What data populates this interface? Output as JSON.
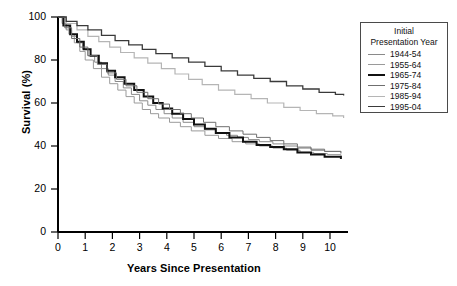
{
  "chart_data": {
    "type": "line",
    "title": "",
    "xlabel": "Years Since Presentation",
    "ylabel": "Survival (%)",
    "xlim": [
      0,
      10.6
    ],
    "ylim": [
      0,
      100
    ],
    "xticks": [
      "0",
      "1",
      "2",
      "3",
      "4",
      "5",
      "6",
      "7",
      "8",
      "9",
      "10"
    ],
    "yticks": [
      "0",
      "20",
      "40",
      "60",
      "80",
      "100"
    ],
    "grid": false,
    "legend_position": "outside-right-top",
    "legend_title_line1": "Initial",
    "legend_title_line2": "Presentation Year",
    "series": [
      {
        "name": "1944-54",
        "color": "#8a8a8a",
        "width": 1.0,
        "x": [
          0,
          0.15,
          0.3,
          0.5,
          0.7,
          0.9,
          1.1,
          1.35,
          1.6,
          1.85,
          2.1,
          2.4,
          2.7,
          3.0,
          3.3,
          3.6,
          3.9,
          4.2,
          4.6,
          5.0,
          5.4,
          5.8,
          6.2,
          6.6,
          7.0,
          7.4,
          7.9,
          8.3,
          8.8,
          9.3,
          9.8,
          10.4
        ],
        "values": [
          100,
          97,
          94,
          91,
          88,
          85,
          82,
          79,
          76,
          73,
          70,
          67,
          64,
          61,
          59,
          57,
          55,
          53,
          51,
          49,
          47.5,
          46,
          45,
          44,
          43,
          42,
          41,
          40,
          39,
          38,
          37.5,
          37
        ]
      },
      {
        "name": "1955-64",
        "color": "#9a9a9a",
        "width": 1.0,
        "x": [
          0,
          0.2,
          0.4,
          0.6,
          0.8,
          1.0,
          1.3,
          1.6,
          1.9,
          2.2,
          2.5,
          2.8,
          3.1,
          3.4,
          3.7,
          4.1,
          4.5,
          4.9,
          5.4,
          5.9,
          6.4,
          6.9,
          7.4,
          7.9,
          8.4,
          8.9,
          9.4,
          9.9,
          10.4
        ],
        "values": [
          100,
          96,
          92,
          88,
          84,
          80,
          76,
          72,
          69,
          66,
          63,
          60,
          57,
          55,
          53,
          51,
          49,
          47,
          45,
          43.5,
          42,
          41,
          40,
          39,
          38,
          37,
          36.5,
          36,
          35.5
        ]
      },
      {
        "name": "1965-74",
        "color": "#111111",
        "width": 2.0,
        "x": [
          0,
          0.2,
          0.45,
          0.7,
          0.95,
          1.2,
          1.5,
          1.8,
          2.1,
          2.45,
          2.8,
          3.15,
          3.5,
          3.85,
          4.2,
          4.6,
          5.0,
          5.4,
          5.8,
          6.3,
          6.8,
          7.3,
          7.8,
          8.3,
          8.8,
          9.3,
          9.8,
          10.4
        ],
        "values": [
          100,
          96,
          92,
          88.5,
          85,
          82,
          78.5,
          75,
          72,
          69,
          66,
          63,
          60,
          57.5,
          55,
          52.5,
          50,
          48,
          46,
          44,
          42,
          40.5,
          39.5,
          38.5,
          37,
          36,
          35,
          34
        ]
      },
      {
        "name": "1975-84",
        "color": "#6f6f6f",
        "width": 1.0,
        "x": [
          0,
          0.25,
          0.5,
          0.8,
          1.1,
          1.45,
          1.8,
          2.15,
          2.5,
          2.9,
          3.3,
          3.7,
          4.1,
          4.5,
          4.9,
          5.35,
          5.8,
          6.3,
          6.8,
          7.3,
          7.8,
          8.3,
          8.8,
          9.3,
          9.8,
          10.4
        ],
        "values": [
          100,
          95,
          90,
          86,
          82,
          78,
          74,
          71,
          68,
          65,
          62,
          59.5,
          57,
          55,
          53,
          51,
          49,
          47,
          45.5,
          44,
          42.5,
          41,
          39.5,
          38.5,
          37.5,
          36.5
        ]
      },
      {
        "name": "1985-94",
        "color": "#b5b5b5",
        "width": 1.2,
        "x": [
          0,
          0.3,
          0.7,
          1.1,
          1.5,
          1.9,
          2.3,
          2.8,
          3.3,
          3.8,
          4.3,
          4.8,
          5.3,
          5.9,
          6.5,
          7.1,
          7.7,
          8.3,
          8.9,
          9.5,
          10.1,
          10.5
        ],
        "values": [
          100,
          97,
          94,
          91,
          88.5,
          86,
          83.5,
          81,
          78.5,
          76,
          73.5,
          71,
          68.5,
          66,
          64,
          62,
          60,
          58,
          56.5,
          55,
          54,
          53
        ]
      },
      {
        "name": "1995-04",
        "color": "#3a3a3a",
        "width": 1.3,
        "x": [
          0,
          0.3,
          0.7,
          1.1,
          1.6,
          2.1,
          2.6,
          3.1,
          3.6,
          4.2,
          4.8,
          5.4,
          6.0,
          6.6,
          7.2,
          7.8,
          8.4,
          9.0,
          9.6,
          10.2,
          10.5
        ],
        "values": [
          100,
          98,
          96,
          94,
          91.5,
          89,
          87,
          85,
          83,
          81,
          79,
          77,
          75,
          73,
          71.5,
          70,
          68,
          66.5,
          65,
          64,
          63.5
        ]
      }
    ]
  }
}
